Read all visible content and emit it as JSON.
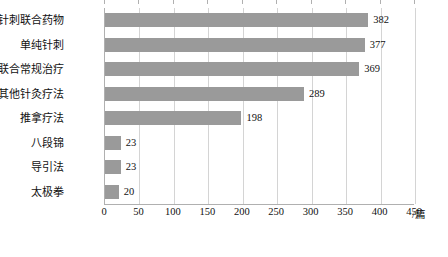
{
  "chart_data": {
    "type": "bar",
    "orientation": "horizontal",
    "title": "",
    "xlabel": "/篇",
    "ylabel": "",
    "xlim": [
      0,
      450
    ],
    "xticks": [
      0,
      50,
      100,
      150,
      200,
      250,
      300,
      350,
      400,
      450
    ],
    "xtick_labels": [
      "0",
      "50",
      "100",
      "150",
      "200",
      "250",
      "300",
      "350",
      "400",
      "450"
    ],
    "grid": true,
    "legend": "none",
    "bar_color": "#9a9a9a",
    "categories": [
      "针刺联合药物",
      "单纯针刺",
      "针刺联合常规治疗",
      "其他针灸疗法",
      "推拿疗法",
      "八段锦",
      "导引法",
      "太极拳"
    ],
    "values": [
      382,
      377,
      369,
      289,
      198,
      23,
      23,
      20
    ],
    "data_labels": [
      "382",
      "377",
      "369",
      "289",
      "198",
      "23",
      "23",
      "20"
    ]
  }
}
